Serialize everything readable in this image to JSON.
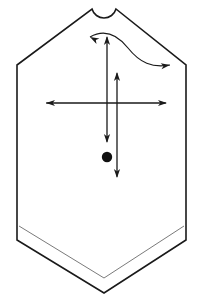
{
  "diagram": {
    "kind": "sewing-pattern-piece",
    "canvas": {
      "width": 204,
      "height": 301,
      "background": "#ffffff"
    },
    "colors": {
      "outline": "#1a1a1a",
      "hem_inner": "#6b6b6b",
      "arrow": "#1a1a1a",
      "marker_dot": "#111111",
      "fill": "#ffffff"
    },
    "outline": {
      "name": "pattern-outline",
      "stroke_width": 1.6,
      "points": "92,9 96,15 100,18.5 104,19.5 108,18.5 112,15 116,9 186,65 186,240 104,293 17,240 17,65",
      "neck_arc": {
        "start_x": 92,
        "start_y": 9,
        "end_x": 116,
        "end_y": 9,
        "radius": 12.5,
        "sweep": 0
      },
      "left_shoulder": {
        "x1": 92,
        "y1": 9,
        "x2": 17,
        "y2": 65
      },
      "right_shoulder": {
        "x1": 116,
        "y1": 9,
        "x2": 186,
        "y2": 65
      },
      "left_side": {
        "x1": 17,
        "y1": 65,
        "x2": 17,
        "y2": 240
      },
      "right_side": {
        "x1": 186,
        "y1": 65,
        "x2": 186,
        "y2": 240
      },
      "hem_left": {
        "x1": 17,
        "y1": 240,
        "x2": 104,
        "y2": 293
      },
      "hem_right": {
        "x1": 104,
        "y1": 293,
        "x2": 186,
        "y2": 240
      }
    },
    "hem_inner": {
      "name": "hem-allowance-line",
      "stroke_width": 0.9,
      "points": "19,226 104,278 184,226"
    },
    "arrows": [
      {
        "id": "horizontal-grainline-arrow",
        "label": "horizontal double-headed arrow",
        "orientation": "horizontal",
        "double_headed": true,
        "x1": 45,
        "y1": 103,
        "x2": 167,
        "y2": 103
      },
      {
        "id": "left-vertical-arrow",
        "label": "left vertical double-headed arrow",
        "orientation": "vertical",
        "double_headed": true,
        "x1": 107,
        "y1": 36,
        "x2": 107,
        "y2": 143
      },
      {
        "id": "right-vertical-arrow",
        "label": "right vertical double-headed arrow",
        "orientation": "vertical",
        "double_headed": true,
        "x1": 117,
        "y1": 72,
        "x2": 117,
        "y2": 178
      }
    ],
    "curve_arrow": {
      "id": "shoulder-drape-curve-arrow",
      "label": "S-curved double-headed arrow across shoulder",
      "double_headed": true,
      "path": "M 90,37 C 104,29 116,33 128,48 C 140,63 152,68 170,65",
      "head_start": {
        "x": 90,
        "y": 37,
        "angle": 208
      },
      "head_end": {
        "x": 170,
        "y": 65,
        "angle": 355
      }
    },
    "marker_dot": {
      "id": "center-marker-dot",
      "label": "pattern reference dot",
      "cx": 107,
      "cy": 157,
      "r": 5.2
    }
  }
}
